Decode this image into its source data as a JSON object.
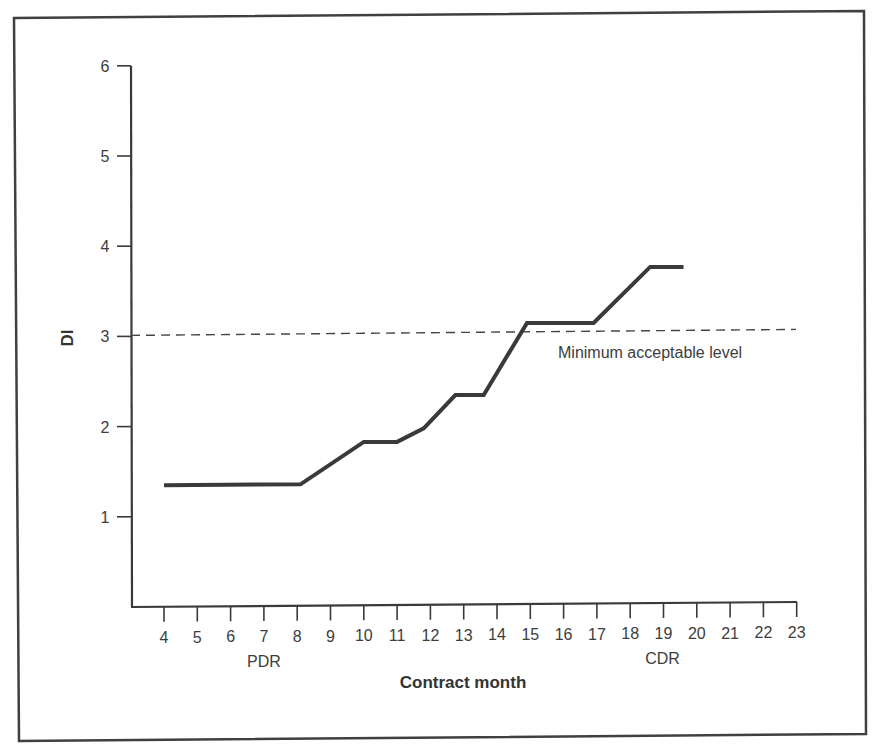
{
  "chart_data": {
    "type": "line",
    "title": "",
    "xlabel": "Contract month",
    "ylabel": "DI",
    "xlim": [
      4,
      23
    ],
    "ylim": [
      0,
      6
    ],
    "x_ticks": [
      4,
      5,
      6,
      7,
      8,
      9,
      10,
      11,
      12,
      13,
      14,
      15,
      16,
      17,
      18,
      19,
      20,
      21,
      22,
      23
    ],
    "y_ticks": [
      1,
      2,
      3,
      4,
      5,
      6
    ],
    "grid": false,
    "legend": null,
    "series": [
      {
        "name": "DI",
        "x": [
          4.0,
          8.1,
          10.0,
          11.0,
          11.8,
          12.75,
          13.6,
          14.9,
          16.9,
          18.6,
          19.6
        ],
        "values": [
          1.35,
          1.36,
          1.83,
          1.83,
          1.98,
          2.35,
          2.35,
          3.15,
          3.15,
          3.77,
          3.77
        ]
      }
    ],
    "reference_lines": [
      {
        "type": "horizontal",
        "y": 3,
        "style": "dashed",
        "label": "Minimum acceptable level"
      }
    ],
    "annotations": [
      {
        "text": "PDR",
        "x": 7,
        "position": "below x-axis"
      },
      {
        "text": "CDR",
        "x": 19,
        "position": "below x-axis"
      }
    ]
  },
  "labels": {
    "y_axis_title": "DI",
    "x_axis_title": "Contract month",
    "reference_label": "Minimum acceptable level",
    "pdr": "PDR",
    "cdr": "CDR"
  },
  "colors": {
    "line": "#3a3a3a",
    "axis": "#3a3a3a",
    "frame": "#404040",
    "text": "#3d3d3d",
    "background": "#ffffff"
  }
}
